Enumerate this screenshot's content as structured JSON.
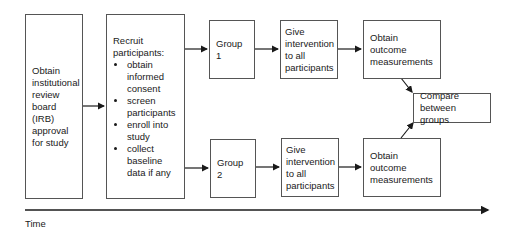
{
  "nodes": {
    "irb": {
      "text": "Obtain institutional review board (IRB) approval for study"
    },
    "recruit": {
      "title": "Recruit participants:",
      "bullets": [
        "obtain informed consent",
        "screen participants",
        "enroll into study",
        "collect baseline data if any"
      ]
    },
    "group1": {
      "text": "Group 1"
    },
    "group2": {
      "text": "Group 2"
    },
    "intervention1": {
      "text": "Give intervention to all participants"
    },
    "intervention2": {
      "text": "Give intervention to all participants"
    },
    "outcome1": {
      "text": "Obtain outcome measurements"
    },
    "outcome2": {
      "text": "Obtain outcome measurements"
    },
    "compare": {
      "text": "Compare between groups"
    }
  },
  "axis": {
    "label": "Time"
  },
  "colors": {
    "line": "#1a1a1a",
    "border": "#555555"
  }
}
